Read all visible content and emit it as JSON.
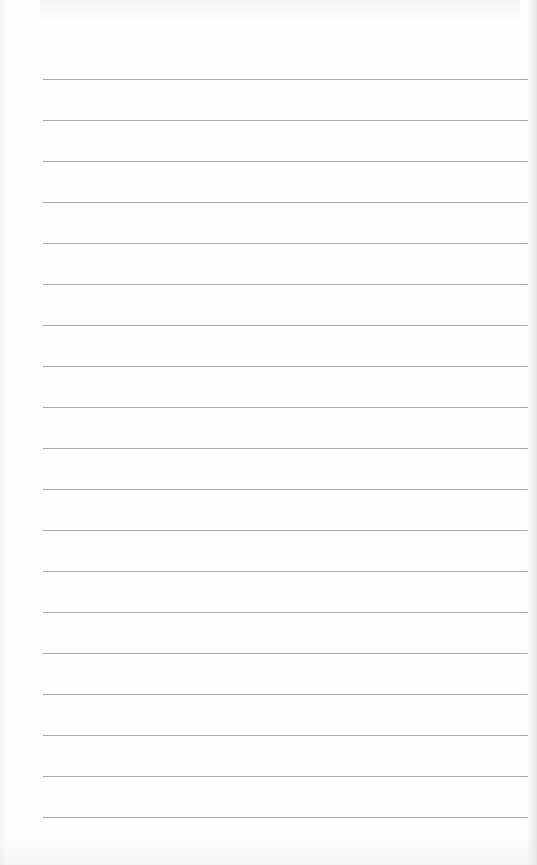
{
  "document": {
    "type": "lined-paper",
    "line_count": 19,
    "first_line_y": 79,
    "line_spacing_px": 41,
    "line_left_x": 43,
    "line_right_x": 528,
    "colors": {
      "paper": "#fefefe",
      "rule": "#9a9a9a"
    },
    "text_content": ""
  }
}
